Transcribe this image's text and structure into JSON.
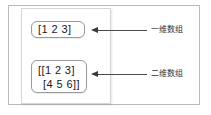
{
  "diagram": {
    "title_visible": false,
    "colors": {
      "background": "#ffffff",
      "outer_frame_border": "#b9b9b9",
      "inner_panel_border": "#d6d6d6",
      "box_border": "#9a9a9a",
      "arrow": "#3a3a3a",
      "text": "#1a1a1a",
      "label_text": "#333333"
    },
    "boxes": [
      {
        "id": "one-dimensional-array",
        "line1": "[1 2 3]",
        "line2": ""
      },
      {
        "id": "two-dimensional-array",
        "line1": "[[1 2 3]",
        "line2": "[4 5 6]]"
      }
    ],
    "annotations": [
      {
        "id": "annotation-one-dimensional",
        "text": "一维数组",
        "arrow_direction": "left"
      },
      {
        "id": "annotation-two-dimensional",
        "text": "二维数组",
        "arrow_direction": "left"
      }
    ]
  }
}
